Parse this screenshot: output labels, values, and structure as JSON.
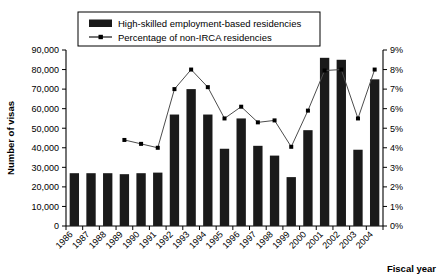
{
  "chart_data": {
    "type": "bar",
    "title": "",
    "xlabel": "Fiscal year",
    "ylabel": "Number of visas",
    "y2label": "",
    "categories": [
      "1986",
      "1987",
      "1988",
      "1989",
      "1990",
      "1991",
      "1992",
      "1993",
      "1994",
      "1995",
      "1996",
      "1997",
      "1998",
      "1999",
      "2000",
      "2001",
      "2002",
      "2003",
      "2004"
    ],
    "ylim": [
      0,
      90000
    ],
    "y2lim": [
      0,
      9
    ],
    "grid": false,
    "legend_position": "top-center",
    "y_ticklabels": [
      "0",
      "10,000",
      "20,000",
      "30,000",
      "40,000",
      "50,000",
      "60,000",
      "70,000",
      "80,000",
      "90,000"
    ],
    "y2_ticklabels": [
      "0%",
      "1%",
      "2%",
      "3%",
      "4%",
      "5%",
      "6%",
      "7%",
      "8%",
      "9%"
    ],
    "series": [
      {
        "name": "High-skilled employment-based residencies",
        "type": "bar",
        "axis": "left",
        "color": "#1a1a1a",
        "values": [
          27000,
          27000,
          27000,
          26500,
          27000,
          27300,
          57000,
          70000,
          57000,
          39500,
          55000,
          41000,
          36000,
          25000,
          49000,
          86000,
          85000,
          39000,
          75000
        ]
      },
      {
        "name": "Percentage of non-IRCA residencies",
        "type": "line",
        "axis": "right",
        "color": "#4d4d4d",
        "values": [
          null,
          null,
          null,
          4.4,
          4.2,
          4.0,
          7.0,
          8.0,
          7.1,
          5.5,
          6.1,
          5.3,
          5.4,
          4.05,
          5.9,
          7.95,
          8.0,
          5.5,
          8.0
        ]
      }
    ]
  },
  "legend": {
    "items": [
      {
        "label": "High-skilled employment-based residencies",
        "marker": "bar-swatch"
      },
      {
        "label": "Percentage of non-IRCA residencies",
        "marker": "line-point"
      }
    ]
  }
}
